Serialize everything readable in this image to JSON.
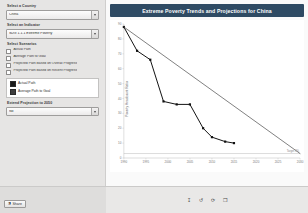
{
  "sidebar": {
    "country": {
      "label": "Select a Country",
      "value": "China",
      "icon": "chevron-down-icon"
    },
    "indicator": {
      "label": "Select an Indicator",
      "value": "SDG 1.1.1 Extreme Poverty",
      "icon": "chevron-down-icon"
    },
    "scenarios": {
      "label": "Select Scenarios",
      "options": [
        {
          "label": "Actual Path",
          "checked": false
        },
        {
          "label": "Average Path to Goal",
          "checked": false
        },
        {
          "label": "Projected Path Based on Overall Progress",
          "checked": false
        },
        {
          "label": "Projected Path Based on Recent Progress",
          "checked": false
        }
      ]
    },
    "legend": {
      "items": [
        {
          "label": "Actual Path",
          "color": "#1a1a1a"
        },
        {
          "label": "Average Path to Goal",
          "color": "#3d3d3d"
        }
      ]
    },
    "extend": {
      "label": "Extend Projection to 2050",
      "value": "No",
      "icon": "chevron-down-icon"
    }
  },
  "toolbar": {
    "icons": [
      {
        "name": "download-icon",
        "glyph": "↧"
      },
      {
        "name": "undo-icon",
        "glyph": "↺"
      },
      {
        "name": "refresh-icon",
        "glyph": "⟳"
      },
      {
        "name": "fullscreen-icon",
        "glyph": "❐"
      }
    ],
    "share_label": "Share",
    "share_icon": "share-icon"
  },
  "chart_data": {
    "type": "line",
    "title": "Extreme Poverty Trends and Projections for China",
    "xlabel": "",
    "ylabel": "Poverty Headcount Ratio",
    "xlim": [
      1990,
      2030
    ],
    "ylim": [
      0,
      90
    ],
    "xticks": [
      1990,
      1995,
      2000,
      2005,
      2010,
      2015,
      2020,
      2025,
      2030
    ],
    "yticks": [
      0,
      10,
      20,
      30,
      40,
      50,
      60,
      70,
      80,
      90
    ],
    "grid": false,
    "legend_position": "sidebar",
    "annotations": [
      {
        "text": "Target 3%",
        "x": 2030,
        "y": 3
      }
    ],
    "reference_lines": [
      {
        "name": "target-line",
        "orientation": "horizontal",
        "y": 3,
        "color": "#b9b9b9"
      }
    ],
    "series": [
      {
        "name": "Actual Path",
        "color": "#111111",
        "marker": "square",
        "x": [
          1990,
          1993,
          1996,
          1999,
          2002,
          2005,
          2008,
          2010,
          2013,
          2015
        ],
        "y": [
          88,
          72,
          66,
          38,
          36,
          36,
          20,
          14,
          11,
          10
        ]
      },
      {
        "name": "Average Path to Goal",
        "color": "#4a4a4a",
        "marker": "none",
        "x": [
          1990,
          2030
        ],
        "y": [
          88,
          3
        ]
      }
    ]
  }
}
